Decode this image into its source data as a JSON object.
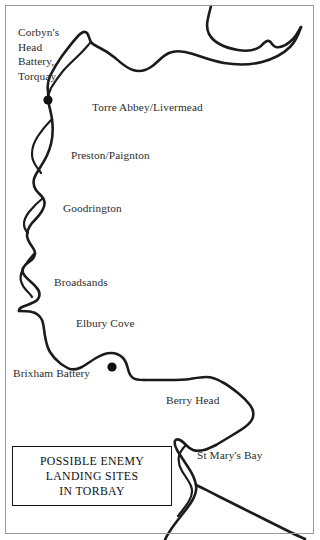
{
  "map": {
    "title_box": {
      "lines": [
        "POSSIBLE ENEMY",
        "LANDING SITES",
        "IN TORBAY"
      ]
    },
    "frame_color": "#9a9a9a",
    "coast_color": "#1b1b1b",
    "background_color": "#ffffff",
    "labels": [
      {
        "id": "corbyns-head-battery-torquay",
        "text": "Corbyn's\nHead\nBattery,\nTorquay",
        "x": 18,
        "y": 25
      },
      {
        "id": "torre-abbey-livermead",
        "text": "Torre Abbey/Livermead",
        "x": 92,
        "y": 100
      },
      {
        "id": "preston-paignton",
        "text": "Preston/Paignton",
        "x": 71,
        "y": 148
      },
      {
        "id": "goodrington",
        "text": "Goodrington",
        "x": 63,
        "y": 201
      },
      {
        "id": "broadsands",
        "text": "Broadsands",
        "x": 54,
        "y": 275
      },
      {
        "id": "elbury-cove",
        "text": "Elbury Cove",
        "x": 76,
        "y": 316
      },
      {
        "id": "brixham-battery",
        "text": "Brixham Battery",
        "x": 13,
        "y": 366
      },
      {
        "id": "berry-head",
        "text": "Berry Head",
        "x": 166,
        "y": 393
      },
      {
        "id": "st-marys-bay",
        "text": "St Mary's Bay",
        "x": 197,
        "y": 448
      }
    ],
    "site_markers": [
      {
        "id": "corbyns-head-marker",
        "x": 48,
        "y": 100,
        "r": 4.6
      },
      {
        "id": "brixham-battery-marker",
        "x": 112,
        "y": 367,
        "r": 4.6
      }
    ]
  }
}
